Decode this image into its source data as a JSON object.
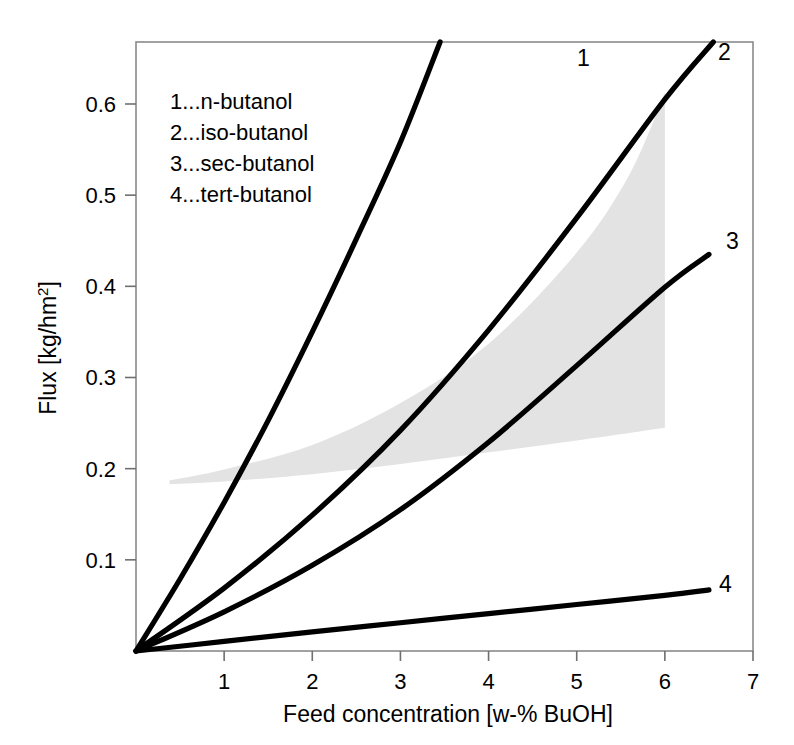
{
  "chart_data": {
    "type": "line",
    "title": "",
    "xlabel": "Feed concentration [w-% BuOH]",
    "ylabel_main": "Flux",
    "ylabel_unit_open": "  [kg/hm",
    "ylabel_unit_sup": "2",
    "ylabel_unit_close": "]",
    "ylabel": "Flux  [kg/hm2]",
    "xlim": [
      0,
      7
    ],
    "ylim": [
      0,
      0.668
    ],
    "grid": false,
    "legend_position": "inside-top-left",
    "xticks": [
      "1",
      "2",
      "3",
      "4",
      "5",
      "6",
      "7"
    ],
    "xtick_values": [
      1,
      2,
      3,
      4,
      5,
      6,
      7
    ],
    "yticks": [
      "0.1",
      "0.2",
      "0.3",
      "0.4",
      "0.5",
      "0.6"
    ],
    "ytick_values": [
      0.1,
      0.2,
      0.3,
      0.4,
      0.5,
      0.6
    ],
    "line_color": "#000000",
    "band_color": "#e3e3e3",
    "axis_color": "#8a8a8a",
    "series": [
      {
        "name": "n-butanol",
        "label": "1",
        "x": [
          0,
          0.5,
          1.0,
          1.5,
          2.0,
          2.5,
          3.0,
          3.45
        ],
        "values": [
          0,
          0.079,
          0.163,
          0.253,
          0.35,
          0.452,
          0.558,
          0.668
        ]
      },
      {
        "name": "iso-butanol",
        "label": "2",
        "x": [
          0,
          1.0,
          2.0,
          3.0,
          4.0,
          5.0,
          6.0,
          6.55
        ],
        "values": [
          0,
          0.069,
          0.149,
          0.242,
          0.352,
          0.475,
          0.605,
          0.668
        ]
      },
      {
        "name": "sec-butanol",
        "label": "3",
        "x": [
          0,
          1.0,
          2.0,
          3.0,
          4.0,
          5.0,
          6.0,
          6.5
        ],
        "values": [
          0,
          0.043,
          0.094,
          0.155,
          0.229,
          0.313,
          0.399,
          0.435
        ]
      },
      {
        "name": "tert-butanol",
        "label": "4",
        "x": [
          0,
          1.0,
          2.0,
          3.0,
          4.0,
          5.0,
          6.0,
          6.5
        ],
        "values": [
          0,
          0.0105,
          0.021,
          0.031,
          0.041,
          0.051,
          0.061,
          0.067
        ]
      }
    ],
    "shaded_band": {
      "description": "literature range band",
      "x_start": 0.38,
      "x_end": 6.0,
      "upper_x": [
        0.38,
        1.0,
        2.0,
        3.0,
        4.0,
        5.0,
        5.6,
        6.0
      ],
      "upper_values": [
        0.187,
        0.199,
        0.226,
        0.272,
        0.337,
        0.437,
        0.523,
        0.613
      ],
      "lower_x": [
        0.38,
        1.0,
        2.0,
        3.0,
        4.0,
        5.0,
        6.0
      ],
      "lower_values": [
        0.183,
        0.186,
        0.194,
        0.205,
        0.218,
        0.231,
        0.245
      ]
    },
    "legend_entries": [
      {
        "key": "1...",
        "text": "1...n-butanol"
      },
      {
        "key": "2...",
        "text": "2...iso-butanol"
      },
      {
        "key": "3...",
        "text": "3...sec-butanol"
      },
      {
        "key": "4...",
        "text": "4...tert-butanol"
      }
    ],
    "curve_end_labels": [
      {
        "label": "1",
        "x": 577,
        "y": 66
      },
      {
        "label": "2",
        "x": 718,
        "y": 60
      },
      {
        "label": "3",
        "x": 726,
        "y": 249
      },
      {
        "label": "4",
        "x": 719,
        "y": 592
      }
    ]
  }
}
